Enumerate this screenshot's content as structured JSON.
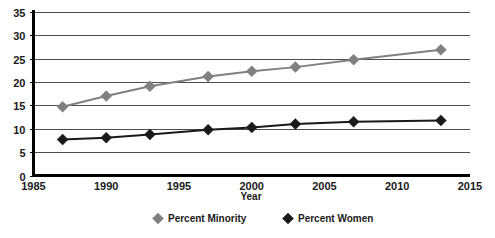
{
  "chart_data": {
    "type": "line",
    "title": "",
    "xlabel": "Year",
    "ylabel": "",
    "xlim": [
      1985,
      2015
    ],
    "ylim": [
      0,
      35
    ],
    "x_ticks": [
      1985,
      1990,
      1995,
      2000,
      2005,
      2010,
      2015
    ],
    "y_ticks": [
      0,
      5,
      10,
      15,
      20,
      25,
      30,
      35
    ],
    "grid": "horizontal",
    "legend_position": "bottom",
    "x": [
      1987,
      1990,
      1993,
      1997,
      2000,
      2003,
      2007,
      2013
    ],
    "series": [
      {
        "name": "Percent Minority",
        "color": "#808080",
        "marker": "diamond",
        "values": [
          14.7,
          17.0,
          19.1,
          21.2,
          22.3,
          23.2,
          24.8,
          26.9
        ]
      },
      {
        "name": "Percent Women",
        "color": "#1a1a1a",
        "marker": "diamond",
        "values": [
          7.7,
          8.1,
          8.8,
          9.8,
          10.3,
          11.0,
          11.5,
          11.8
        ]
      }
    ]
  },
  "axes": {
    "x_tick_labels": [
      "1985",
      "1990",
      "1995",
      "2000",
      "2005",
      "2010",
      "2015"
    ],
    "y_tick_labels": [
      "0",
      "5",
      "10",
      "15",
      "20",
      "25",
      "30",
      "35"
    ],
    "x_axis_title": "Year"
  },
  "legend": {
    "items": [
      {
        "label": "Percent Minority",
        "color": "#808080"
      },
      {
        "label": "Percent Women",
        "color": "#1a1a1a"
      }
    ]
  }
}
